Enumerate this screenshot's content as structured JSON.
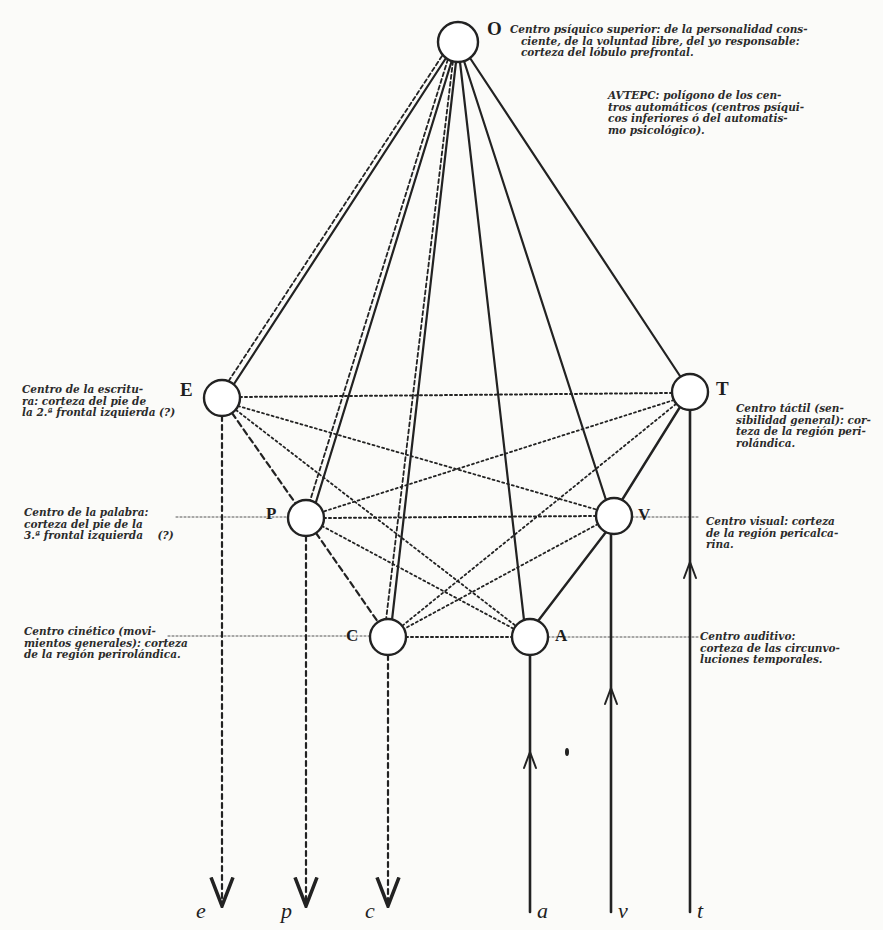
{
  "diagram": {
    "nodes": {
      "O": {
        "letter": "O",
        "x": 458,
        "y": 42,
        "r": 20
      },
      "E": {
        "letter": "E",
        "x": 222,
        "y": 398,
        "r": 18
      },
      "T": {
        "letter": "T",
        "x": 690,
        "y": 392,
        "r": 18
      },
      "P": {
        "letter": "P",
        "x": 306,
        "y": 518,
        "r": 18
      },
      "V": {
        "letter": "V",
        "x": 614,
        "y": 516,
        "r": 18
      },
      "C": {
        "letter": "C",
        "x": 388,
        "y": 637,
        "r": 18
      },
      "A": {
        "letter": "A",
        "x": 530,
        "y": 637,
        "r": 18
      }
    },
    "labels": {
      "O": "Centro psíquico superior: de la personalidad cons-\n   ciente, de la voluntad libre, del yo responsable:\n   corteza del lóbulo prefrontal.",
      "polygon": "AVTEPC: polígono de los cen-\ntros automáticos (centros psíqui-\ncos inferiores ó del automatis-\nmo psicológico).",
      "E": "Centro de la escritu-\nra: corteza del pie de\nla 2.ª frontal izquierda (?)",
      "P": "Centro de la palabra:\ncorteza del pie de la\n3.ª frontal izquierda    (?)",
      "C": "Centro cinético (movi-\nmientos generales): corteza\nde la región perirolándica.",
      "T": "Centro táctil (sen-\nsibilidad general): cor-\nteza de la región peri-\nrolándica.",
      "V": "Centro visual: corteza\nde la región pericalca-\nrina.",
      "A": "Centro auditivo:\ncorteza de las circunvo-\nluciones temporales."
    },
    "io_letters": {
      "e": "e",
      "p": "p",
      "c": "c",
      "a": "a",
      "v": "v",
      "t": "t"
    }
  }
}
